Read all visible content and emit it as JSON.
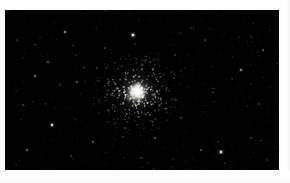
{
  "image": {
    "subject": "globular-star-cluster",
    "caption": "",
    "width": 290,
    "height": 183,
    "frame": {
      "border_color": "#fdfdfd",
      "field_left": 5,
      "field_top": 10,
      "field_width": 274,
      "field_height": 160
    }
  },
  "sky": {
    "background_color": "#000000",
    "faint_glow_color": "#0a0a0c",
    "star_color": "#ffffff",
    "cluster": {
      "name": "globular-cluster-core",
      "center_x": 132,
      "center_y": 82,
      "core_radius": 7,
      "halo_radius": 34,
      "core_color": "#fbfbf4",
      "halo_color": "#cfcfc8",
      "member_star_count": 420,
      "member_spread": 30
    },
    "field_stars": [
      {
        "x": 128,
        "y": 25,
        "r": 1.3,
        "b": 0.95
      },
      {
        "x": 60,
        "y": 22,
        "r": 0.9,
        "b": 0.55
      },
      {
        "x": 100,
        "y": 38,
        "r": 0.6,
        "b": 0.4
      },
      {
        "x": 43,
        "y": 52,
        "r": 0.7,
        "b": 0.45
      },
      {
        "x": 30,
        "y": 66,
        "r": 0.8,
        "b": 0.5
      },
      {
        "x": 72,
        "y": 72,
        "r": 0.7,
        "b": 0.42
      },
      {
        "x": 18,
        "y": 95,
        "r": 0.6,
        "b": 0.35
      },
      {
        "x": 47,
        "y": 115,
        "r": 1.2,
        "b": 0.8
      },
      {
        "x": 88,
        "y": 132,
        "r": 0.7,
        "b": 0.45
      },
      {
        "x": 66,
        "y": 146,
        "r": 0.6,
        "b": 0.38
      },
      {
        "x": 22,
        "y": 140,
        "r": 0.8,
        "b": 0.48
      },
      {
        "x": 120,
        "y": 118,
        "r": 0.6,
        "b": 0.35
      },
      {
        "x": 150,
        "y": 128,
        "r": 0.7,
        "b": 0.4
      },
      {
        "x": 176,
        "y": 108,
        "r": 0.6,
        "b": 0.36
      },
      {
        "x": 196,
        "y": 140,
        "r": 0.7,
        "b": 0.42
      },
      {
        "x": 216,
        "y": 142,
        "r": 1.3,
        "b": 0.85
      },
      {
        "x": 246,
        "y": 128,
        "r": 0.6,
        "b": 0.34
      },
      {
        "x": 236,
        "y": 60,
        "r": 0.9,
        "b": 0.58
      },
      {
        "x": 258,
        "y": 40,
        "r": 0.7,
        "b": 0.42
      },
      {
        "x": 200,
        "y": 30,
        "r": 0.6,
        "b": 0.36
      },
      {
        "x": 170,
        "y": 45,
        "r": 0.6,
        "b": 0.33
      },
      {
        "x": 148,
        "y": 60,
        "r": 0.6,
        "b": 0.38
      },
      {
        "x": 108,
        "y": 95,
        "r": 0.6,
        "b": 0.34
      },
      {
        "x": 92,
        "y": 58,
        "r": 0.6,
        "b": 0.32
      },
      {
        "x": 254,
        "y": 94,
        "r": 0.6,
        "b": 0.3
      },
      {
        "x": 208,
        "y": 82,
        "r": 0.6,
        "b": 0.33
      },
      {
        "x": 136,
        "y": 148,
        "r": 0.6,
        "b": 0.33
      },
      {
        "x": 262,
        "y": 150,
        "r": 0.6,
        "b": 0.3
      },
      {
        "x": 12,
        "y": 30,
        "r": 0.6,
        "b": 0.3
      },
      {
        "x": 186,
        "y": 18,
        "r": 0.5,
        "b": 0.28
      }
    ],
    "noise_star_count": 900
  }
}
